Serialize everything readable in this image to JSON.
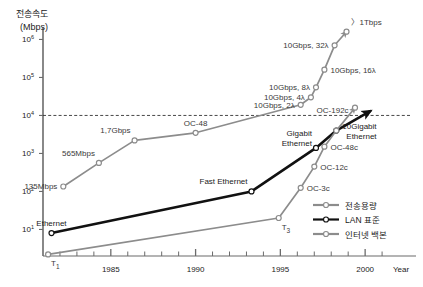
{
  "figure": {
    "y_axis_title_line1": "전송속도",
    "y_axis_title_line2": "(Mbps)",
    "x_axis_title": "Year"
  },
  "axes": {
    "y_ticks": [
      {
        "base": "10",
        "exp": "6"
      },
      {
        "base": "10",
        "exp": "5"
      },
      {
        "base": "10",
        "exp": "4"
      },
      {
        "base": "10",
        "exp": "3"
      },
      {
        "base": "10",
        "exp": "2"
      },
      {
        "base": "10",
        "exp": "1"
      }
    ],
    "x_ticks": [
      "1985",
      "1990",
      "1995",
      "2000"
    ]
  },
  "legend": {
    "items": [
      {
        "label": "전송용량",
        "style": "dashed-gray",
        "color": "#8c8c8c"
      },
      {
        "label": "LAN 표준",
        "style": "solid-black",
        "color": "#111111"
      },
      {
        "label": "인터넷 백본",
        "style": "solid-gray",
        "color": "#8c8c8c"
      }
    ]
  },
  "annotations": {
    "transmission_capacity": [
      "135Mbps",
      "565Mbps",
      "1,7Gbps",
      "OC-48",
      "10Gbps, 2λ",
      "10Gbps, 4λ",
      "10Gbps, 8λ",
      "10Gbps, 16λ",
      "10Gbps, 32λ",
      "〉1Tbps",
      "OC-192c"
    ],
    "lan_standard": [
      "Ethernet",
      "Fast Ethernet",
      "Gigabit Ethernet",
      "10Gigabit Ethernet"
    ],
    "internet_backbone": [
      "T1",
      "T3",
      "OC-3c",
      "OC-12c",
      "OC-48c"
    ]
  },
  "chart_data": {
    "type": "line",
    "title": "",
    "subtitle": "",
    "xlabel": "Year",
    "ylabel": "전송속도 (Mbps)",
    "xlim": [
      1981,
      2003
    ],
    "ylim": [
      2,
      2000000
    ],
    "yscale": "log",
    "grid": false,
    "legend_position": "bottom-right",
    "reference_lines": [
      {
        "axis": "y",
        "value": 10000,
        "style": "dashed",
        "color": "#333333",
        "label": "10^4"
      }
    ],
    "series": [
      {
        "name": "전송용량",
        "legend_key": "transmission-capacity",
        "color": "#8c8c8c",
        "style": "solid-gray-markers",
        "arrow_end": true,
        "points": [
          {
            "x": 1982.2,
            "y": 135,
            "label": "135Mbps",
            "label_pos": "left"
          },
          {
            "x": 1984.3,
            "y": 565,
            "label": "565Mbps",
            "label_pos": "above-left"
          },
          {
            "x": 1986.4,
            "y": 2200,
            "label": "1,7Gbps",
            "label_pos": "above-left"
          },
          {
            "x": 1990.0,
            "y": 3500,
            "label": "OC-48",
            "label_pos": "above"
          },
          {
            "x": 1996.2,
            "y": 19000,
            "label": "10Gbps, 2λ",
            "label_pos": "left"
          },
          {
            "x": 1996.8,
            "y": 30000,
            "label": "10Gbps, 4λ",
            "label_pos": "left"
          },
          {
            "x": 1997.1,
            "y": 55000,
            "label": "10Gbps, 8λ",
            "label_pos": "left"
          },
          {
            "x": 1997.6,
            "y": 160000,
            "label": "10Gbps, 16λ",
            "label_pos": "right"
          },
          {
            "x": 1998.2,
            "y": 700000,
            "label": "10Gbps, 32λ",
            "label_pos": "left"
          },
          {
            "x": 1998.9,
            "y": 1600000,
            "label": "〉1Tbps",
            "label_pos": "above-right"
          }
        ],
        "extra_labels": [
          {
            "text": "OC-192c",
            "x": 1996.9,
            "y": 13500
          }
        ]
      },
      {
        "name": "LAN 표준",
        "legend_key": "lan-standard",
        "color": "#111111",
        "style": "solid-black-thick",
        "arrow_end": true,
        "points": [
          {
            "x": 1981.5,
            "y": 8,
            "label": "Ethernet",
            "label_pos": "above"
          },
          {
            "x": 1993.3,
            "y": 100,
            "label": "Fast Ethernet",
            "label_pos": "above-left"
          },
          {
            "x": 1997.1,
            "y": 1400,
            "label": "Gigabit Ethernet",
            "label_pos": "above-left"
          },
          {
            "x": 1998.3,
            "y": 4000,
            "label": "10Gigabit Ethernet",
            "label_pos": "right"
          },
          {
            "x": 2000.3,
            "y": 13000,
            "label": "",
            "label_pos": "none"
          }
        ]
      },
      {
        "name": "인터넷 백본",
        "legend_key": "internet-backbone",
        "color": "#8c8c8c",
        "style": "solid-gray-markers",
        "arrow_end": true,
        "points": [
          {
            "x": 1981.3,
            "y": 2.2,
            "label": "T1",
            "label_pos": "below-right"
          },
          {
            "x": 1994.9,
            "y": 20,
            "label": "T3",
            "label_pos": "below-right"
          },
          {
            "x": 1996.2,
            "y": 125,
            "label": "OC-3c",
            "label_pos": "right"
          },
          {
            "x": 1997.0,
            "y": 450,
            "label": "OC-12c",
            "label_pos": "right"
          },
          {
            "x": 1997.6,
            "y": 1500,
            "label": "OC-48c",
            "label_pos": "right"
          },
          {
            "x": 1998.3,
            "y": 4000,
            "label": "",
            "label_pos": "none"
          },
          {
            "x": 1999.4,
            "y": 16000,
            "label": "",
            "label_pos": "none"
          }
        ]
      }
    ]
  }
}
